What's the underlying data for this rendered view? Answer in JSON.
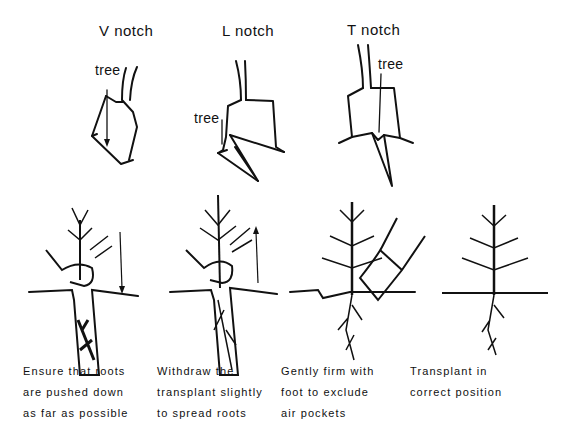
{
  "notches": [
    {
      "title": "V notch",
      "tree_label": "tree"
    },
    {
      "title": "L notch",
      "tree_label": "tree"
    },
    {
      "title": "T notch",
      "tree_label": "tree"
    }
  ],
  "steps": [
    {
      "lines": [
        "Ensure that roots",
        "are pushed down",
        "as far as possible"
      ],
      "arrow": "down"
    },
    {
      "lines": [
        "Withdraw the",
        "transplant slightly",
        "to spread roots"
      ],
      "arrow": "up"
    },
    {
      "lines": [
        "Gently firm with",
        "foot to exclude",
        "air pockets"
      ]
    },
    {
      "lines": [
        "Transplant in",
        "correct position"
      ]
    }
  ]
}
